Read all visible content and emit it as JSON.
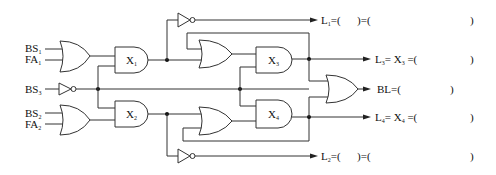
{
  "diagram": {
    "type": "logic-circuit",
    "inputs": [
      {
        "id": "BS1",
        "base": "BS",
        "sub": "1"
      },
      {
        "id": "FA1",
        "base": "FA",
        "sub": "1"
      },
      {
        "id": "BS3",
        "base": "BS",
        "sub": "3"
      },
      {
        "id": "BS2",
        "base": "BS",
        "sub": "2"
      },
      {
        "id": "FA2",
        "base": "FA",
        "sub": "2"
      }
    ],
    "gates": [
      {
        "id": "OR1",
        "type": "OR",
        "label": ""
      },
      {
        "id": "OR2",
        "type": "OR",
        "label": ""
      },
      {
        "id": "NOT_BS3",
        "type": "NOT",
        "label": ""
      },
      {
        "id": "X1",
        "type": "AND",
        "label": "X",
        "sub": "1"
      },
      {
        "id": "X2",
        "type": "AND",
        "label": "X",
        "sub": "2"
      },
      {
        "id": "X3",
        "type": "AND",
        "label": "X",
        "sub": "3"
      },
      {
        "id": "X4",
        "type": "AND",
        "label": "X",
        "sub": "4"
      },
      {
        "id": "OR3",
        "type": "OR",
        "label": ""
      },
      {
        "id": "OR4",
        "type": "OR",
        "label": ""
      },
      {
        "id": "NOT_X1",
        "type": "NOT",
        "label": ""
      },
      {
        "id": "NOT_X2",
        "type": "NOT",
        "label": ""
      },
      {
        "id": "OR_BL",
        "type": "OR",
        "label": ""
      }
    ],
    "outputs": [
      {
        "id": "L1",
        "base": "L",
        "sub": "1",
        "expr": "=(      )=(",
        "close": ")"
      },
      {
        "id": "L3",
        "base": "L",
        "sub": "3",
        "expr": "= X",
        "expr_sub": "3",
        "expr2": " =(",
        "close": ")"
      },
      {
        "id": "BL",
        "base": "BL",
        "sub": "",
        "expr": "=(",
        "close": ")"
      },
      {
        "id": "L4",
        "base": "L",
        "sub": "4",
        "expr": "= X",
        "expr_sub": "4",
        "expr2": " =(",
        "close": ")"
      },
      {
        "id": "L2",
        "base": "L",
        "sub": "2",
        "expr": "=(      )=(",
        "close": ")"
      }
    ]
  }
}
